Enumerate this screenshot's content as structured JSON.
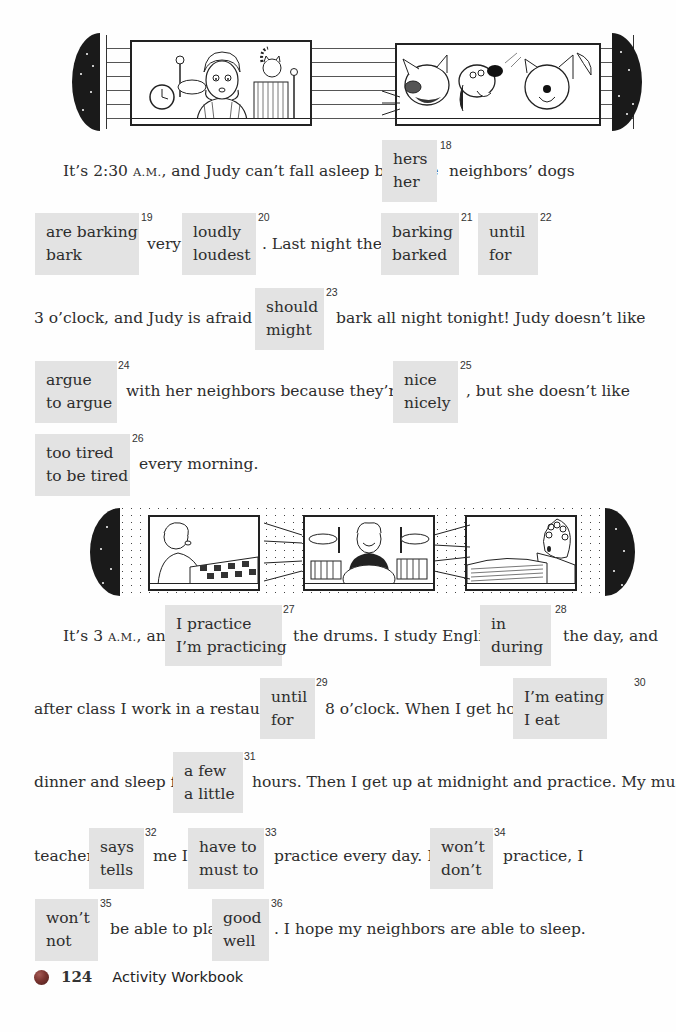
{
  "illustrations": {
    "top": {
      "description": "Judy sitting awake at her window at night with an alarm clock and a cat; neighbors' three dogs barking in the window across",
      "panels": [
        "judy-awake-window",
        "barking-dogs-window"
      ]
    },
    "middle": {
      "description": "A neighbor woken up, a young man playing drums loudly, and another neighbor in bed awake",
      "panels": [
        "awake-neighbor-window",
        "drummer-window",
        "sleeping-neighbor-window"
      ]
    }
  },
  "exercise": {
    "paragraph1": {
      "line1": {
        "before": "It’s 2:30 ",
        "sc": "A.M.",
        "after": ", and Judy can’t fall asleep because",
        "post": "neighbors’ dogs"
      },
      "line2": {
        "very": "very",
        "last_night": ".  Last night they"
      },
      "line3": {
        "before": "3 o’clock, and Judy is afraid they",
        "after": "bark all night tonight!  Judy doesn’t like"
      },
      "line4": {
        "middle": "with her neighbors because they’re very",
        "after": ", but she doesn’t like"
      },
      "line5": {
        "after": "every morning."
      }
    },
    "paragraph2": {
      "line1": {
        "before": "It’s 3 ",
        "sc": "A.M.",
        "before2": ", and",
        "middle": "the drums.  I study English",
        "after": "the day, and"
      },
      "line2": {
        "before": "after class I work in a restaurant",
        "middle": "8 o’clock.  When I get home,"
      },
      "line3": {
        "before": "dinner and sleep for",
        "after": "hours.  Then I get up at midnight and practice.  My music"
      },
      "line4": {
        "before": "teacher",
        "middle1": "me I",
        "middle2": "practice every day.  If I",
        "after": "practice, I"
      },
      "line5": {
        "middle": "be able to play",
        "after": ".  I hope my neighbors are able to sleep."
      }
    },
    "choices": [
      {
        "number": "18",
        "options": [
          "hers",
          "her"
        ]
      },
      {
        "number": "19",
        "options": [
          "are barking",
          "bark"
        ]
      },
      {
        "number": "20",
        "options": [
          "loudly",
          "loudest"
        ]
      },
      {
        "number": "21",
        "options": [
          "barking",
          "barked"
        ]
      },
      {
        "number": "22",
        "options": [
          "until",
          "for"
        ]
      },
      {
        "number": "23",
        "options": [
          "should",
          "might"
        ]
      },
      {
        "number": "24",
        "options": [
          "argue",
          "to argue"
        ]
      },
      {
        "number": "25",
        "options": [
          "nice",
          "nicely"
        ]
      },
      {
        "number": "26",
        "options": [
          "too tired",
          "to be tired"
        ]
      },
      {
        "number": "27",
        "options": [
          "I practice",
          "I’m practicing"
        ]
      },
      {
        "number": "28",
        "options": [
          "in",
          "during"
        ]
      },
      {
        "number": "29",
        "options": [
          "until",
          "for"
        ]
      },
      {
        "number": "30",
        "options": [
          "I’m eating",
          "I eat"
        ]
      },
      {
        "number": "31",
        "options": [
          "a few",
          "a little"
        ]
      },
      {
        "number": "32",
        "options": [
          "says",
          "tells"
        ]
      },
      {
        "number": "33",
        "options": [
          "have to",
          "must to"
        ]
      },
      {
        "number": "34",
        "options": [
          "won’t",
          "don’t"
        ]
      },
      {
        "number": "35",
        "options": [
          "won’t",
          "not"
        ]
      },
      {
        "number": "36",
        "options": [
          "good",
          "well"
        ]
      }
    ]
  },
  "footer": {
    "page_number": "124",
    "book_title": "Activity Workbook",
    "bullet_color": "#7a3430"
  },
  "colors": {
    "choice_box_bg": "#e3e3e3",
    "text": "#2d2d2d"
  }
}
